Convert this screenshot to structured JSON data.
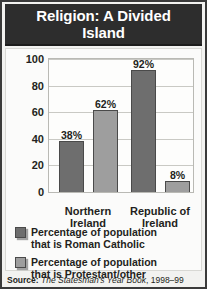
{
  "title": "Religion: A Divided Island",
  "source": {
    "prefix": "Source:",
    "book": "The Statesman's Year Book",
    "edition": ", 1998–99"
  },
  "colors": {
    "title_background": "#2d2d2d",
    "title_text": "#ffffff",
    "panel_background": "#fbfbfa",
    "figure_background": "#f2f2f0",
    "frame": "#3a3a3a",
    "series_catholic": "#6e6e6e",
    "series_protestant": "#9e9e9e",
    "bar_outline": "#4a4a4a",
    "gridline": "#c9c9c4",
    "text": "#231f20"
  },
  "legend": [
    {
      "label": "Percentage of population\nthat is Roman Catholic",
      "color": "#6e6e6e"
    },
    {
      "label": "Percentage of population\nthat is Protestant/other",
      "color": "#9e9e9e"
    }
  ],
  "chart_data": {
    "type": "bar",
    "title": "Religion: A Divided Island",
    "xlabel": "",
    "ylabel": "",
    "ylim": [
      0,
      100
    ],
    "yticks": [
      0,
      20,
      40,
      60,
      80,
      100
    ],
    "grid": true,
    "legend_position": "bottom-left",
    "categories": [
      "Northern\nIreland",
      "Republic of\nIreland"
    ],
    "series": [
      {
        "name": "Percentage of population that is Roman Catholic",
        "values": [
          38,
          92
        ],
        "color": "#6e6e6e"
      },
      {
        "name": "Percentage of population that is Protestant/other",
        "values": [
          62,
          8
        ],
        "color": "#9e9e9e"
      }
    ],
    "data_labels": [
      [
        "38%",
        "92%"
      ],
      [
        "62%",
        "8%"
      ]
    ],
    "source": "Source: The Statesman's Year Book, 1998–99"
  }
}
